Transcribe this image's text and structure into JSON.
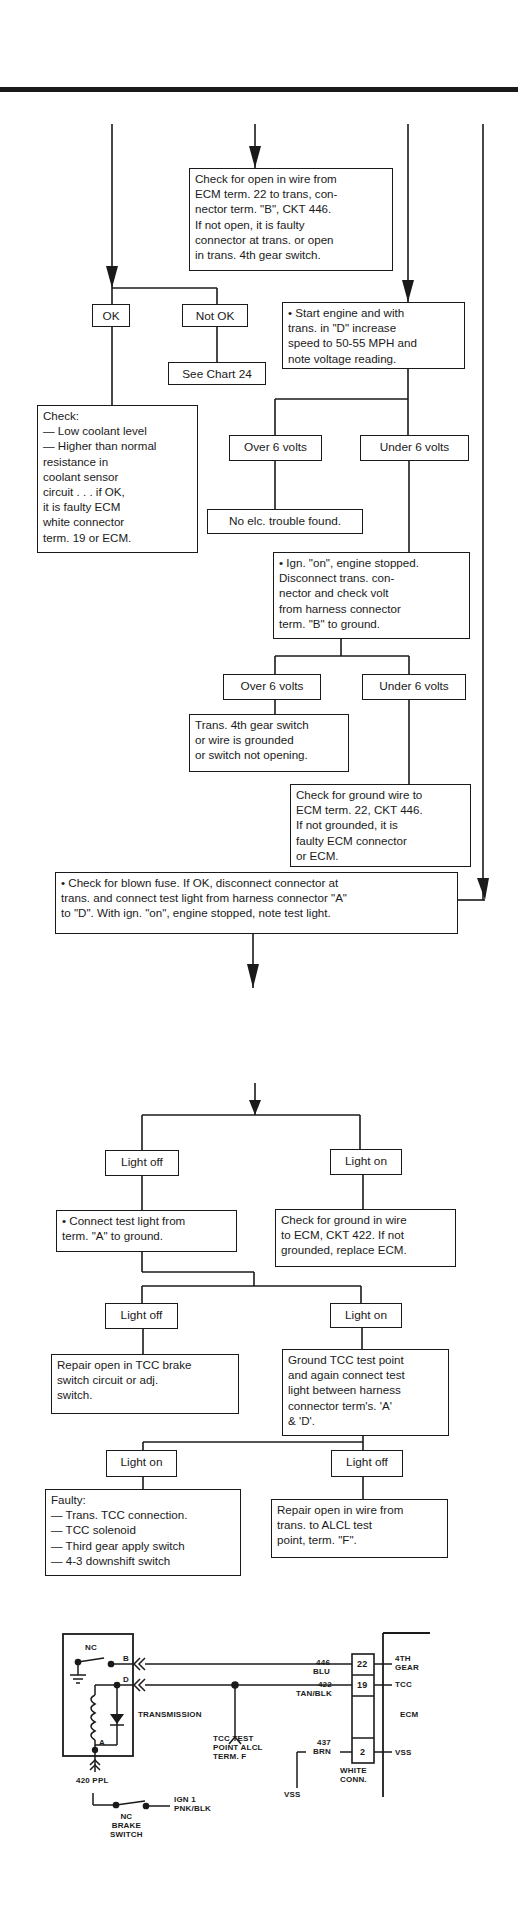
{
  "flowchart_top": {
    "box_check_open": "Check for open in wire from\nECM term. 22 to trans, con-\nnector term. \"B\", CKT 446.\nIf not open, it is faulty\nconnector at trans. or open\nin trans. 4th gear switch.",
    "label_ok": "OK",
    "label_not_ok": "Not OK",
    "box_see_chart": "See Chart 24",
    "box_start_engine": "• Start engine and with\n   trans. in \"D\" increase\n   speed to 50-55 MPH and\n   note voltage reading.",
    "box_check_coolant": "Check:\n— Low coolant level\n— Higher than normal\n     resistance in\n     coolant sensor\n     circuit . . . if OK,\n   it is faulty ECM\n   white connector\n   term. 19 or ECM.",
    "label_over6_a": "Over 6 volts",
    "label_under6_a": "Under 6 volts",
    "box_no_trouble": "No elc. trouble found.",
    "box_ign_on": "• Ign. \"on\", engine stopped.\n   Disconnect trans. con-\n   nector and check volt\n   from harness connector\n   term. \"B\" to ground.",
    "label_over6_b": "Over 6 volts",
    "label_under6_b": "Under 6 volts",
    "box_trans_4th": "Trans. 4th gear switch\nor wire is grounded\nor switch not opening.",
    "box_check_ground": "Check for ground wire to\nECM term. 22, CKT 446.\nIf not grounded, it is\nfaulty ECM connector\nor ECM.",
    "box_blown_fuse": "• Check for blown fuse. If OK, disconnect connector at\n   trans. and connect test light from harness connector \"A\"\n   to \"D\". With ign. \"on\", engine stopped, note test light."
  },
  "flowchart_bottom": {
    "label_light_off_a": "Light off",
    "label_light_on_a": "Light on",
    "box_connect_test": "• Connect test light from\n   term. \"A\" to ground.",
    "box_check_ground_422": "Check for ground in wire\nto ECM, CKT 422. If not\ngrounded, replace ECM.",
    "label_light_off_b": "Light off",
    "label_light_on_b": "Light on",
    "box_repair_brake": "Repair open in TCC brake\nswitch circuit or adj.\nswitch.",
    "box_ground_tcc": "Ground TCC test point\nand again connect test\nlight between harness\nconnector term's. 'A'\n& 'D'.",
    "label_light_on_c": "Light on",
    "label_light_off_c": "Light off",
    "box_faulty": "Faulty:\n— Trans. TCC connection.\n— TCC solenoid\n— Third gear apply switch\n— 4-3 downshift switch",
    "box_repair_alcl": "Repair open in wire from\ntrans. to ALCL test\npoint, term. \"F\"."
  },
  "wiring": {
    "nc_top": "NC",
    "term_b": "B",
    "term_d": "D",
    "term_a": "A",
    "transmission": "TRANSMISSION",
    "tcc_test_point": "TCC TEST\nPOINT ALCL\nTERM. F",
    "wire_420": "420 PPL",
    "ign1": "IGN 1\nPNK/BLK",
    "brake_switch": "NC\nBRAKE\nSWITCH",
    "wire_446": "446\nBLU",
    "wire_422": "422\nTAN/BLK",
    "wire_437": "437\nBRN",
    "pin_22": "22",
    "pin_19": "19",
    "pin_2": "2",
    "white_conn": "WHITE\nCONN.",
    "vss_left": "VSS",
    "ecm_4th_gear": "4TH\nGEAR",
    "ecm_tcc": "TCC",
    "ecm_label": "ECM",
    "ecm_vss": "VSS"
  }
}
